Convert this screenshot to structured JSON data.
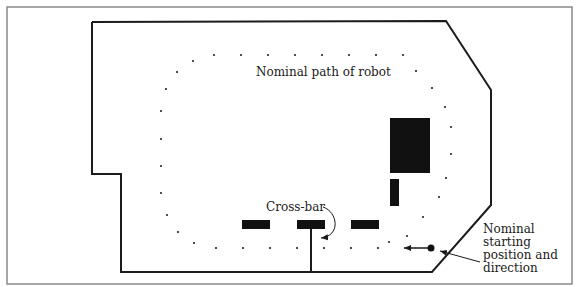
{
  "figure": {
    "frame": {
      "x": 7,
      "y": 7,
      "w": 565,
      "h": 277,
      "stroke": "#8a8a8a"
    },
    "colors": {
      "wall": "#1c1c1c",
      "obstacle": "#111111",
      "dot": "#222222",
      "text": "#1a1a1a"
    },
    "labels": {
      "path_label": "Nominal path of robot",
      "crossbar_label": "Cross-bar",
      "start_label_lines": [
        "Nominal",
        "starting",
        "position and",
        "direction"
      ]
    },
    "arena_outline": [
      [
        92,
        22
      ],
      [
        446,
        21
      ],
      [
        491,
        90
      ],
      [
        491,
        205
      ],
      [
        432,
        272
      ],
      [
        121,
        272
      ],
      [
        121,
        174
      ],
      [
        92,
        174
      ],
      [
        92,
        22
      ]
    ],
    "obstacles": [
      {
        "name": "large-block",
        "x": 390,
        "y": 118,
        "w": 40,
        "h": 55
      },
      {
        "name": "small-block",
        "x": 390,
        "y": 179,
        "w": 9,
        "h": 27
      },
      {
        "name": "bar-left",
        "x": 242,
        "y": 220,
        "w": 28,
        "h": 9
      },
      {
        "name": "bar-center",
        "x": 297,
        "y": 220,
        "w": 28,
        "h": 9
      },
      {
        "name": "bar-right",
        "x": 351,
        "y": 220,
        "w": 28,
        "h": 9
      }
    ],
    "crossbar_post": {
      "x": 311,
      "y1": 229,
      "y2": 272
    },
    "path_dots": [
      [
        214,
        55
      ],
      [
        241,
        55
      ],
      [
        268,
        55
      ],
      [
        295,
        55
      ],
      [
        322,
        55
      ],
      [
        349,
        55
      ],
      [
        376,
        55
      ],
      [
        403,
        55
      ],
      [
        416,
        71
      ],
      [
        432,
        88
      ],
      [
        445,
        107
      ],
      [
        451,
        127
      ],
      [
        451,
        154
      ],
      [
        446,
        178
      ],
      [
        439,
        197
      ],
      [
        423,
        217
      ],
      [
        407,
        236
      ],
      [
        389,
        242
      ],
      [
        378,
        248
      ],
      [
        351,
        248
      ],
      [
        324,
        248
      ],
      [
        297,
        248
      ],
      [
        270,
        248
      ],
      [
        243,
        248
      ],
      [
        216,
        248
      ],
      [
        194,
        243
      ],
      [
        178,
        232
      ],
      [
        167,
        215
      ],
      [
        161,
        193
      ],
      [
        161,
        166
      ],
      [
        161,
        139
      ],
      [
        161,
        111
      ],
      [
        166,
        89
      ],
      [
        177,
        72
      ],
      [
        193,
        61
      ]
    ],
    "start_marker": {
      "cx": 431,
      "cy": 248,
      "r": 3.5,
      "arrow_to_x": 404
    },
    "pointer_arrow": {
      "from": [
        480,
        262
      ],
      "to": [
        440,
        251
      ]
    }
  }
}
